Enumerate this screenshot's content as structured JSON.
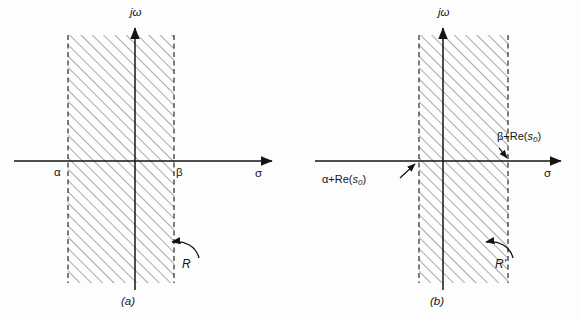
{
  "figure": {
    "type": "diagram",
    "background_color": "#fdfdfd",
    "line_color": "#141414",
    "hatch_color": "#555555",
    "panels": [
      {
        "id": "a",
        "caption": "(a)",
        "caption_pos": {
          "x": 128,
          "y": 303
        },
        "axes": {
          "vertical_label": "jω",
          "vertical_label_pos": {
            "x": 136,
            "y": 14
          },
          "horizontal_label": "σ",
          "horizontal_label_pos": {
            "x": 259,
            "y": 174
          },
          "origin": {
            "x": 135,
            "y": 161
          },
          "x_axis": {
            "x1": 14,
            "y1": 161,
            "x2": 275,
            "y2": 161
          },
          "y_axis": {
            "x1": 135,
            "y1": 290,
            "x2": 135,
            "y2": 24
          }
        },
        "region": {
          "name": "R",
          "label": "R",
          "label_pos": {
            "x": 185,
            "y": 264
          },
          "left_boundary_label": "α",
          "left_boundary_label_pos": {
            "x": 57,
            "y": 179
          },
          "right_boundary_label": "β",
          "right_boundary_label_pos": {
            "x": 179,
            "y": 179
          },
          "left_x": 68,
          "right_x": 174,
          "top_y": 35,
          "bottom_y": 283,
          "boundary_style": "dashed",
          "fill_style": "hatched-45"
        },
        "annotation_arrow": {
          "name": "region-pointer-R",
          "from": {
            "x": 200,
            "y": 258
          },
          "to": {
            "x": 168,
            "y": 243
          }
        }
      },
      {
        "id": "b",
        "caption": "(b)",
        "caption_pos": {
          "x": 437,
          "y": 303
        },
        "axes": {
          "vertical_label": "jω",
          "vertical_label_pos": {
            "x": 444,
            "y": 14
          },
          "horizontal_label": "σ",
          "horizontal_label_pos": {
            "x": 548,
            "y": 174
          },
          "origin": {
            "x": 443,
            "y": 161
          },
          "x_axis": {
            "x1": 315,
            "y1": 161,
            "x2": 564,
            "y2": 161
          },
          "y_axis": {
            "x1": 443,
            "y1": 290,
            "x2": 443,
            "y2": 24
          }
        },
        "region": {
          "name": "R'",
          "label": "R'",
          "label_pos": {
            "x": 498,
            "y": 264
          },
          "left_boundary_label": "α+Re(s0)",
          "left_boundary_label_pos": {
            "x": 322,
            "y": 181
          },
          "right_boundary_label": "β+Re(s0)",
          "right_boundary_label_pos": {
            "x": 497,
            "y": 138
          },
          "left_x": 419,
          "right_x": 508,
          "top_y": 35,
          "bottom_y": 283,
          "boundary_style": "dashed",
          "fill_style": "hatched-45"
        },
        "annotation_arrow": {
          "name": "region-pointer-Rprime",
          "from": {
            "x": 514,
            "y": 258
          },
          "to": {
            "x": 482,
            "y": 243
          }
        },
        "leader_lines": [
          {
            "name": "alpha-leader",
            "from": {
              "x": 398,
              "y": 180
            },
            "to": {
              "x": 419,
              "y": 162
            }
          },
          {
            "name": "beta-leader",
            "from": {
              "x": 500,
              "y": 146
            },
            "to": {
              "x": 509,
              "y": 160
            }
          }
        ]
      }
    ],
    "labels": {
      "jomega": "jω",
      "sigma": "σ",
      "alpha": "α",
      "beta": "β",
      "R": "R",
      "R_prime": "R'",
      "caption_a": "(a)",
      "caption_b": "(b)",
      "alpha_re_s0_prefix": "α+Re(",
      "alpha_re_s0_var": "s",
      "alpha_re_s0_sub": "0",
      "alpha_re_s0_suffix": ")",
      "beta_re_s0_prefix": "β+Re(",
      "beta_re_s0_var": "s",
      "beta_re_s0_sub": "0",
      "beta_re_s0_suffix": ")"
    }
  }
}
